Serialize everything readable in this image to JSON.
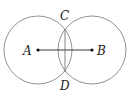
{
  "diagram": {
    "title": "",
    "points": [
      {
        "id": "A",
        "label": "A",
        "x": 38,
        "y": 50
      },
      {
        "id": "B",
        "label": "B",
        "x": 92,
        "y": 50
      },
      {
        "id": "C",
        "label": "C",
        "x": 65,
        "y": 27
      },
      {
        "id": "D",
        "label": "D",
        "x": 65,
        "y": 73
      }
    ],
    "circles": [
      {
        "center": "A",
        "radius": 34
      },
      {
        "center": "B",
        "radius": 34
      }
    ],
    "segments": [
      {
        "from": "A",
        "to": "B"
      },
      {
        "from": "C",
        "to": "D"
      }
    ],
    "labels": {
      "A": "A",
      "B": "B",
      "C": "C",
      "D": "D"
    }
  }
}
